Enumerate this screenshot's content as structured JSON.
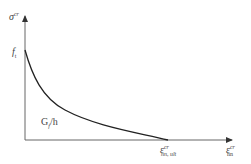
{
  "diagram": {
    "y_axis": {
      "symbol": "σ",
      "superscript": "cr"
    },
    "x_axis": {
      "symbol": "ε",
      "superscript": "cr",
      "subscript": "nn"
    },
    "labels": {
      "peak": {
        "symbol": "f",
        "subscript": "t"
      },
      "area": {
        "text": "G",
        "subscript": "f",
        "suffix": "/h"
      },
      "ultimate": {
        "symbol": "ε",
        "superscript": "cr",
        "subscript": "nn, ult"
      }
    },
    "colors": {
      "axis": "#555555",
      "curve": "#222222",
      "text": "#444444"
    }
  }
}
